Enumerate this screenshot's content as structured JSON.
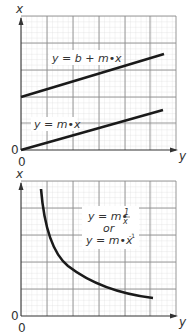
{
  "figure": {
    "panels": [
      {
        "id": "linear",
        "axes": {
          "vertical_label": "x",
          "horizontal_label": "y",
          "origin_labels": [
            "0",
            "0"
          ]
        },
        "annotations": {
          "upper_line": "y = b + m•x",
          "lower_line": "y = m•x"
        }
      },
      {
        "id": "inverse",
        "axes": {
          "vertical_label": "x",
          "horizontal_label": "y",
          "origin_labels": [
            "0",
            "0"
          ]
        },
        "annotations": {
          "formula_line1": "y = m•",
          "fraction_num": "1",
          "fraction_den": "x",
          "or_text": "or",
          "formula_line2": "y = m•x",
          "exponent": "-1"
        }
      }
    ]
  },
  "colors": {
    "minor_grid": "#d9d9d9",
    "major_grid": "#8c8c8c",
    "curve": "#1a1a1a",
    "text": "#333333",
    "background": "#ffffff"
  }
}
